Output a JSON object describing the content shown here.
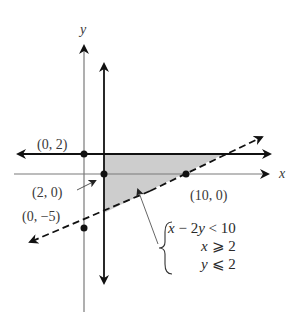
{
  "figure": {
    "type": "linear-inequality-system-graph",
    "axes": {
      "x_label": "x",
      "y_label": "y"
    },
    "points": [
      {
        "label": "(0, 2)",
        "x": 0,
        "y": 2
      },
      {
        "label": "(2, 0)",
        "x": 2,
        "y": 0
      },
      {
        "label": "(10, 0)",
        "x": 10,
        "y": 0
      },
      {
        "label": "(0, −5)",
        "x": 0,
        "y": -5
      }
    ],
    "boundary_lines": [
      {
        "equation": "x - 2y = 10",
        "style": "dashed"
      },
      {
        "equation": "x = 2",
        "style": "solid"
      },
      {
        "equation": "y = 2",
        "style": "solid"
      }
    ],
    "shaded_region": {
      "fill": "#c8c8c8",
      "vertices_approx": [
        [
          2,
          2
        ],
        [
          14,
          2
        ],
        [
          2,
          -4
        ]
      ]
    },
    "system": {
      "ineq1": {
        "lhs": "x",
        "op1": " − 2",
        "var": "y",
        "rel": " < 10"
      },
      "ineq2": {
        "var": "x",
        "rel": " ⩾ 2"
      },
      "ineq3": {
        "var": "y",
        "rel": " ⩽ 2"
      }
    },
    "colors": {
      "axis": "#7a7a7a",
      "boundary": "#111111",
      "shade": "#c8c8c8",
      "text": "#333333"
    }
  }
}
